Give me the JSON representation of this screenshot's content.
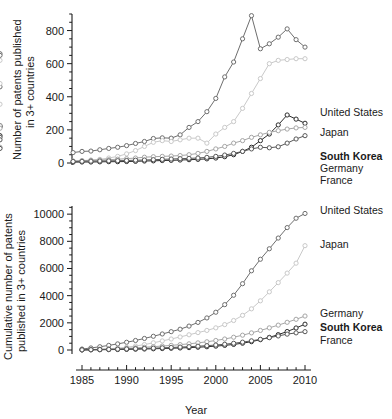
{
  "figure": {
    "background": "#ffffff",
    "xlabel": "Year"
  },
  "series_colors": {
    "United States": "#6e6e6e",
    "Japan": "#c9c9c9",
    "South Korea": "#2b2b2b",
    "Germany": "#a6a6a6",
    "France": "#585858"
  },
  "panel_top": {
    "ylabel_line1": "Number of patents published",
    "ylabel_line2": "in 3+ countries",
    "ytick_labels": [
      "0",
      "200",
      "400",
      "600",
      "800"
    ],
    "legend": [
      {
        "label": "United States",
        "color": "#6e6e6e",
        "bold": false
      },
      {
        "label": "Japan",
        "color": "#c9c9c9",
        "bold": false
      },
      {
        "label": "South Korea",
        "color": "#2b2b2b",
        "bold": true
      },
      {
        "label": "Germany",
        "color": "#a6a6a6",
        "bold": false
      },
      {
        "label": "France",
        "color": "#585858",
        "bold": false
      }
    ]
  },
  "panel_bottom": {
    "ylabel_line1": "Cumulative number of patents",
    "ylabel_line2": "published in 3+ countries",
    "ytick_labels": [
      "0",
      "2000",
      "4000",
      "6000",
      "8000",
      "10000"
    ],
    "xtick_labels": [
      "1985",
      "1990",
      "1995",
      "2000",
      "2005",
      "2010"
    ],
    "xlabel": "Year",
    "legend": [
      {
        "label": "United States",
        "color": "#6e6e6e",
        "bold": false
      },
      {
        "label": "Japan",
        "color": "#c9c9c9",
        "bold": false
      },
      {
        "label": "Germany",
        "color": "#a6a6a6",
        "bold": false
      },
      {
        "label": "South Korea",
        "color": "#2b2b2b",
        "bold": true
      },
      {
        "label": "France",
        "color": "#585858",
        "bold": false
      }
    ]
  },
  "chart_data": [
    {
      "type": "line",
      "id": "annual-patents",
      "title": "",
      "xlabel": "",
      "ylabel": "Number of patents published in 3+ countries",
      "xlim": [
        1984,
        2011
      ],
      "ylim": [
        0,
        900
      ],
      "yticks": [
        0,
        200,
        400,
        600,
        800
      ],
      "xticks": [
        1985,
        1990,
        1995,
        2000,
        2005,
        2010
      ],
      "grid": false,
      "legend_position": "right",
      "x": [
        1984,
        1985,
        1986,
        1987,
        1988,
        1989,
        1990,
        1991,
        1992,
        1993,
        1994,
        1995,
        1996,
        1997,
        1998,
        1999,
        2000,
        2001,
        2002,
        2003,
        2004,
        2005,
        2006,
        2007,
        2008,
        2009,
        2010
      ],
      "series": [
        {
          "name": "United States",
          "color": "#6e6e6e",
          "values": [
            63,
            70,
            72,
            80,
            88,
            95,
            105,
            118,
            130,
            148,
            152,
            150,
            170,
            215,
            250,
            310,
            390,
            520,
            610,
            750,
            890,
            690,
            720,
            760,
            810,
            745,
            700,
            660,
            650,
            460
          ]
        },
        {
          "name": "Japan",
          "color": "#c9c9c9",
          "values": [
            10,
            14,
            18,
            22,
            30,
            40,
            55,
            75,
            100,
            125,
            135,
            130,
            140,
            150,
            150,
            120,
            175,
            215,
            250,
            330,
            420,
            510,
            600,
            620,
            625,
            630,
            630,
            620,
            480,
            355
          ]
        },
        {
          "name": "South Korea",
          "color": "#2b2b2b",
          "values": [
            5,
            6,
            6,
            7,
            8,
            8,
            9,
            10,
            12,
            13,
            15,
            16,
            18,
            20,
            22,
            25,
            30,
            38,
            50,
            70,
            95,
            135,
            175,
            230,
            290,
            265,
            240,
            225,
            218,
            165
          ]
        },
        {
          "name": "Germany",
          "color": "#a6a6a6",
          "values": [
            12,
            14,
            16,
            18,
            20,
            23,
            26,
            30,
            35,
            38,
            40,
            42,
            45,
            50,
            58,
            70,
            85,
            100,
            120,
            135,
            155,
            170,
            185,
            195,
            205,
            212,
            215,
            225,
            210,
            95
          ]
        },
        {
          "name": "France",
          "color": "#585858",
          "values": [
            9,
            10,
            11,
            12,
            13,
            14,
            15,
            17,
            18,
            20,
            22,
            24,
            26,
            28,
            30,
            34,
            40,
            48,
            58,
            70,
            85,
            95,
            92,
            98,
            120,
            145,
            165,
            155,
            140,
            88
          ]
        }
      ]
    },
    {
      "type": "line",
      "id": "cumulative-patents",
      "title": "",
      "xlabel": "Year",
      "ylabel": "Cumulative number of patents published in 3+ countries",
      "xlim": [
        1984,
        2011
      ],
      "ylim": [
        0,
        10600
      ],
      "yticks": [
        0,
        2000,
        4000,
        6000,
        8000,
        10000
      ],
      "xticks": [
        1985,
        1990,
        1995,
        2000,
        2005,
        2010
      ],
      "grid": false,
      "legend_position": "right",
      "x": [
        1985,
        1986,
        1987,
        1988,
        1989,
        1990,
        1991,
        1992,
        1993,
        1994,
        1995,
        1996,
        1997,
        1998,
        1999,
        2000,
        2001,
        2002,
        2003,
        2004,
        2005,
        2006,
        2007,
        2008,
        2009,
        2010
      ],
      "series": [
        {
          "name": "United States",
          "color": "#6e6e6e",
          "values": [
            70,
            150,
            240,
            340,
            450,
            570,
            700,
            850,
            1010,
            1180,
            1350,
            1530,
            1760,
            2030,
            2360,
            2780,
            3340,
            4030,
            4880,
            5830,
            6680,
            7450,
            8240,
            9010,
            9700,
            10050
          ]
        },
        {
          "name": "Japan",
          "color": "#c9c9c9",
          "values": [
            14,
            32,
            56,
            92,
            140,
            205,
            290,
            400,
            530,
            670,
            810,
            960,
            1120,
            1280,
            1440,
            1630,
            1870,
            2170,
            2550,
            3030,
            3620,
            4280,
            4960,
            5660,
            6390,
            7680
          ]
        },
        {
          "name": "Germany",
          "color": "#a6a6a6",
          "values": [
            14,
            30,
            48,
            70,
            95,
            125,
            160,
            200,
            245,
            290,
            340,
            395,
            455,
            525,
            605,
            700,
            810,
            940,
            1090,
            1260,
            1440,
            1630,
            1830,
            2040,
            2260,
            2500
          ]
        },
        {
          "name": "South Korea",
          "color": "#2b2b2b",
          "values": [
            6,
            12,
            20,
            28,
            37,
            48,
            60,
            74,
            90,
            108,
            128,
            150,
            175,
            205,
            240,
            285,
            340,
            410,
            500,
            615,
            760,
            930,
            1130,
            1360,
            1620,
            1900
          ]
        },
        {
          "name": "France",
          "color": "#585858",
          "values": [
            10,
            21,
            33,
            46,
            60,
            76,
            94,
            114,
            136,
            160,
            186,
            214,
            244,
            278,
            318,
            366,
            424,
            494,
            578,
            676,
            786,
            906,
            1034,
            1168,
            1262,
            1350
          ]
        }
      ]
    }
  ]
}
